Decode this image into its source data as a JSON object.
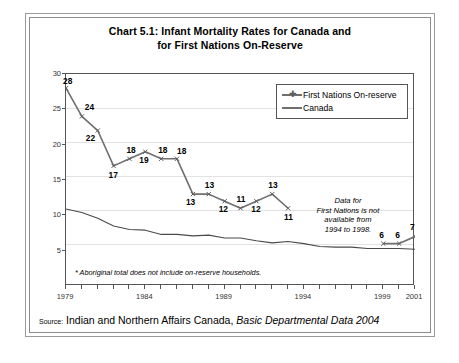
{
  "chart_title_line1": "Chart 5.1: Infant Mortality Rates for Canada and",
  "chart_title_line2": "for First Nations On-Reserve",
  "legend": {
    "items": [
      {
        "label": "First Nations On-reserve",
        "marker": "cross-marker",
        "color": "#6f6f6f"
      },
      {
        "label": "Canada",
        "marker": "none",
        "color": "#4a4a4a"
      }
    ]
  },
  "annotation": {
    "line1": "Data for",
    "line2": "First Nations is not",
    "line3": "available from",
    "line4": "1994 to 1998."
  },
  "footnote": "* Aboriginal total does not include on-reserve households.",
  "source": {
    "label": "Source:",
    "agency": "Indian and Northern Affairs Canada,",
    "publication": "Basic Departmental Data 2004"
  },
  "chart_data": {
    "type": "line",
    "title": "Chart 5.1: Infant Mortality Rates for Canada and for First Nations On-Reserve",
    "xlabel": "",
    "ylabel": "Deaths per 1,000 live births",
    "xlim": [
      1979,
      2001
    ],
    "ylim": [
      0,
      30
    ],
    "ytick_labels": [
      "5",
      "10",
      "15",
      "20",
      "25",
      "30"
    ],
    "ytick_values": [
      5,
      10,
      15,
      20,
      25,
      30
    ],
    "xtick_labels": [
      "1979",
      "1984",
      "1989",
      "1994",
      "1999",
      "2001"
    ],
    "xtick_values": [
      1979,
      1984,
      1989,
      1994,
      1999,
      2001
    ],
    "grid": true,
    "legend_position": "top-right",
    "series": [
      {
        "name": "First Nations On-reserve",
        "color": "#6f6f6f",
        "marker": "cross",
        "labels_shown": true,
        "segments": [
          {
            "x": [
              1979,
              1980,
              1981,
              1982,
              1983,
              1984,
              1985,
              1986,
              1987,
              1988,
              1989,
              1990,
              1991,
              1992,
              1993
            ],
            "values": [
              28,
              24,
              22,
              17,
              18,
              19,
              18,
              18,
              13,
              13,
              12,
              11,
              12,
              13,
              11
            ]
          },
          {
            "x": [
              1999,
              2000,
              2001
            ],
            "values": [
              6,
              6,
              7
            ]
          }
        ],
        "gap_note": "Data for First Nations is not available from 1994 to 1998."
      },
      {
        "name": "Canada",
        "color": "#4a4a4a",
        "marker": "none",
        "labels_shown": false,
        "x": [
          1979,
          1980,
          1981,
          1982,
          1983,
          1984,
          1985,
          1986,
          1987,
          1988,
          1989,
          1990,
          1991,
          1992,
          1993,
          1994,
          1995,
          1996,
          1997,
          1998,
          1999,
          2000,
          2001
        ],
        "values": [
          10.9,
          10.4,
          9.6,
          8.5,
          8.0,
          7.9,
          7.3,
          7.3,
          7.1,
          7.2,
          6.8,
          6.8,
          6.4,
          6.1,
          6.3,
          6.0,
          5.6,
          5.5,
          5.5,
          5.3,
          5.3,
          5.3,
          5.2
        ]
      }
    ]
  }
}
